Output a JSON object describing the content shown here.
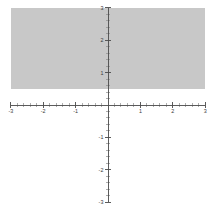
{
  "figure": {
    "title": "",
    "background_color": "#ffffff",
    "width": 213,
    "height": 214
  },
  "chart_data": {
    "type": "area",
    "title": "",
    "subtitle": "",
    "xlabel": "",
    "ylabel": "",
    "xlim": [
      -3,
      3
    ],
    "ylim": [
      -3,
      3
    ],
    "grid": false,
    "legend": null,
    "legend_position": "none",
    "axes": {
      "x_axis": {
        "label": "",
        "min": -3,
        "max": 3,
        "major_tick_step": 1,
        "minor_tick_step": 0.2,
        "tick_values": [
          -3,
          -2,
          -1,
          1,
          2,
          3
        ],
        "tick_labels": [
          "-3",
          "-2",
          "-1",
          "1",
          "2",
          "3"
        ],
        "zero_label_shown": false
      },
      "y_axis": {
        "label": "",
        "min": -3,
        "max": 3,
        "major_tick_step": 1,
        "minor_tick_step": 0.2,
        "tick_values": [
          3,
          2,
          1,
          -1,
          -2,
          -3
        ],
        "tick_labels": [
          "3",
          "2",
          "1",
          "-1",
          "-2",
          "-3"
        ],
        "zero_label_shown": false
      }
    },
    "regions": [
      {
        "name": "shaded-half-plane",
        "description": "Shaded half-plane above the horizontal boundary",
        "inequality": "y >= 0.5",
        "boundary_value": 0.5,
        "boundary_orientation": "horizontal",
        "boundary_visible": false,
        "x_from": -3,
        "x_to": 3,
        "y_from": 0.5,
        "y_to": 3,
        "fill_color": "#c8c8c8",
        "opacity": 1
      }
    ],
    "series": [
      {
        "name": "shaded region y >= 0.5",
        "type": "area",
        "fill_color": "#c8c8c8",
        "x": [
          -3,
          3
        ],
        "y_lower": [
          0.5,
          0.5
        ],
        "y_upper": [
          3,
          3
        ]
      }
    ],
    "colors": {
      "region_fill": "#c8c8c8",
      "axis": "#4a4a4a",
      "minor_tick": "#8d8d8d",
      "tick_label": "#3a3a3a",
      "background": "#ffffff"
    }
  }
}
